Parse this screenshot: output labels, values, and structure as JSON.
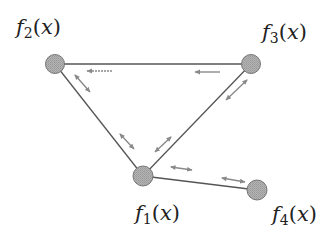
{
  "colors": {
    "edge": "#555555",
    "node_fill": "#a9a9a9",
    "node_stroke": "#777777",
    "arrow": "#8a8a8a",
    "label": "#222222",
    "background": "#ffffff"
  },
  "nodes": [
    {
      "id": "f1",
      "func": "f",
      "index": "1",
      "arg": "x",
      "open": "(",
      "close": ")",
      "cx": 143,
      "cy": 176,
      "r": 10
    },
    {
      "id": "f2",
      "func": "f",
      "index": "2",
      "arg": "x",
      "open": "(",
      "close": ")",
      "cx": 55,
      "cy": 64,
      "r": 9.5
    },
    {
      "id": "f3",
      "func": "f",
      "index": "3",
      "arg": "x",
      "open": "(",
      "close": ")",
      "cx": 251,
      "cy": 64,
      "r": 9.5
    },
    {
      "id": "f4",
      "func": "f",
      "index": "4",
      "arg": "x",
      "open": "(",
      "close": ")",
      "cx": 257,
      "cy": 190,
      "r": 10
    }
  ],
  "edges": [
    {
      "from": "f2",
      "to": "f3"
    },
    {
      "from": "f2",
      "to": "f1"
    },
    {
      "from": "f3",
      "to": "f1"
    },
    {
      "from": "f1",
      "to": "f4"
    }
  ],
  "arrows": [
    {
      "edge": "f3-f2",
      "type": "single",
      "direction": "toward f2",
      "x1": 112,
      "y1": 71,
      "x2": 87,
      "y2": 71,
      "dashed": true
    },
    {
      "edge": "f3-f2",
      "type": "single",
      "direction": "toward f2",
      "x1": 220,
      "y1": 72,
      "x2": 195,
      "y2": 72,
      "dashed": false
    },
    {
      "edge": "f2-f1",
      "type": "double",
      "x1": 75,
      "y1": 75,
      "x2": 90,
      "y2": 92
    },
    {
      "edge": "f2-f1",
      "type": "double",
      "x1": 120,
      "y1": 134,
      "x2": 134,
      "y2": 149
    },
    {
      "edge": "f3-f1",
      "type": "double",
      "x1": 247,
      "y1": 80,
      "x2": 226,
      "y2": 100
    },
    {
      "edge": "f3-f1",
      "type": "double",
      "x1": 171,
      "y1": 137,
      "x2": 155,
      "y2": 152
    },
    {
      "edge": "f1-f4",
      "type": "double",
      "x1": 171,
      "y1": 167,
      "x2": 192,
      "y2": 170
    },
    {
      "edge": "f1-f4",
      "type": "double",
      "x1": 222,
      "y1": 178,
      "x2": 245,
      "y2": 182
    }
  ],
  "labels": {
    "f1": {
      "text": "f1(x)",
      "left": 135,
      "top": 203
    },
    "f2": {
      "text": "f2(x)",
      "left": 16,
      "top": 17
    },
    "f3": {
      "text": "f3(x)",
      "left": 262,
      "top": 22
    },
    "f4": {
      "text": "f4(x)",
      "left": 272,
      "top": 204
    }
  }
}
